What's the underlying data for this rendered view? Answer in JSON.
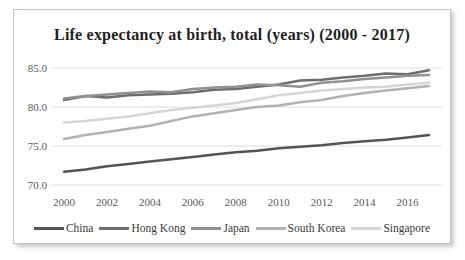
{
  "chart_data": {
    "type": "line",
    "title": "Life expectancy at birth, total (years) (2000 - 2017)",
    "xlabel": "",
    "ylabel": "",
    "x": [
      2000,
      2001,
      2002,
      2003,
      2004,
      2005,
      2006,
      2007,
      2008,
      2009,
      2010,
      2011,
      2012,
      2013,
      2014,
      2015,
      2016,
      2017
    ],
    "xticks": [
      2000,
      2002,
      2004,
      2006,
      2008,
      2010,
      2012,
      2014,
      2016
    ],
    "xtick_labels": [
      "2000",
      "2002",
      "2004",
      "2006",
      "2008",
      "2010",
      "2012",
      "2014",
      "2016"
    ],
    "yticks": [
      85,
      80,
      75,
      70
    ],
    "ytick_labels": [
      "85.0",
      "80.0",
      "75.0",
      "70.0"
    ],
    "ylim": [
      70,
      85
    ],
    "grid": "horizontal",
    "gridline_color": "#dcdcdc",
    "legend_position": "bottom",
    "series": [
      {
        "name": "China",
        "color": "#545454",
        "values": [
          71.7,
          72.0,
          72.4,
          72.7,
          73.0,
          73.3,
          73.6,
          73.9,
          74.2,
          74.4,
          74.7,
          74.9,
          75.1,
          75.4,
          75.6,
          75.8,
          76.1,
          76.4
        ]
      },
      {
        "name": "Hong Kong",
        "color": "#6e6e6e",
        "values": [
          80.9,
          81.4,
          81.2,
          81.5,
          81.6,
          81.7,
          81.9,
          82.2,
          82.3,
          82.6,
          82.9,
          83.4,
          83.5,
          83.8,
          84.0,
          84.3,
          84.2,
          84.7
        ]
      },
      {
        "name": "Japan",
        "color": "#909090",
        "values": [
          81.1,
          81.4,
          81.6,
          81.8,
          82.0,
          81.9,
          82.3,
          82.5,
          82.6,
          82.9,
          82.8,
          82.6,
          83.1,
          83.3,
          83.6,
          83.8,
          84.0,
          84.1
        ]
      },
      {
        "name": "South Korea",
        "color": "#b2b2b2",
        "values": [
          75.9,
          76.4,
          76.8,
          77.2,
          77.6,
          78.2,
          78.8,
          79.2,
          79.6,
          80.0,
          80.2,
          80.6,
          80.9,
          81.4,
          81.8,
          82.1,
          82.4,
          82.7
        ]
      },
      {
        "name": "Singapore",
        "color": "#d5d5d5",
        "values": [
          78.0,
          78.2,
          78.5,
          78.8,
          79.2,
          79.6,
          79.9,
          80.2,
          80.5,
          81.0,
          81.5,
          81.8,
          82.1,
          82.3,
          82.5,
          82.6,
          82.9,
          83.1
        ]
      }
    ]
  }
}
